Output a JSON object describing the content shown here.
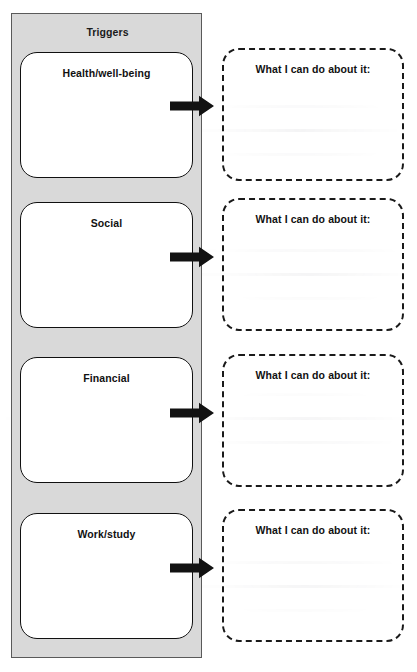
{
  "worksheet": {
    "panel_title": "Triggers",
    "panel_color": "#d9d9d9",
    "outline_color": "#5a5a5a",
    "card_border_color": "#111111",
    "dashed_border_color": "#1a1a1a",
    "arrow_color": "#111111",
    "rows": [
      {
        "trigger_label": "Health/well-being",
        "response_label": "What I can do about it:",
        "response_value": "",
        "arrow_name": "arrow-health"
      },
      {
        "trigger_label": "Social",
        "response_label": "What I can do about it:",
        "response_value": "",
        "arrow_name": "arrow-social"
      },
      {
        "trigger_label": "Financial",
        "response_label": "What I can do about it:",
        "response_value": "",
        "arrow_name": "arrow-financial"
      },
      {
        "trigger_label": "Work/study",
        "response_label": "What I can do about it:",
        "response_value": "",
        "arrow_name": "arrow-work-study"
      }
    ]
  }
}
